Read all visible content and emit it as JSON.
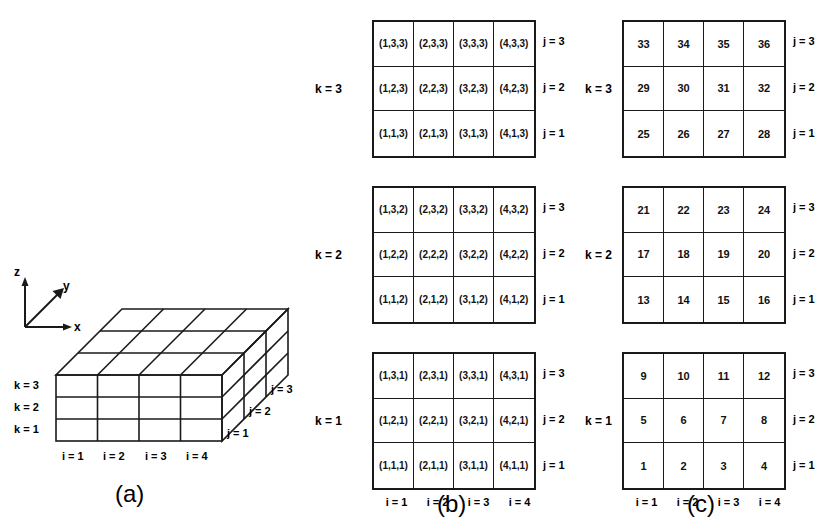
{
  "figure": {
    "panels": [
      {
        "id": "a",
        "caption": "(a)"
      },
      {
        "id": "b",
        "caption": "(b)"
      },
      {
        "id": "c",
        "caption": "(c)"
      }
    ]
  },
  "axes": {
    "x": "x",
    "y": "y",
    "z": "z"
  },
  "panel_a": {
    "k_labels": [
      "k = 3",
      "k = 2",
      "k = 1"
    ],
    "i_labels": [
      "i = 1",
      "i = 2",
      "i = 3",
      "i = 4"
    ],
    "j_labels": [
      "j = 1",
      "j = 2",
      "j = 3"
    ],
    "dims": {
      "ni": 4,
      "nj": 3,
      "nk": 3
    }
  },
  "panel_b": {
    "row_j_labels": [
      "j = 3",
      "j = 2",
      "j = 1"
    ],
    "i_labels": [
      "i = 1",
      "i = 2",
      "i = 3",
      "i = 4"
    ],
    "blocks": [
      {
        "k_label": "k = 3",
        "rows": [
          [
            "(1,3,3)",
            "(2,3,3)",
            "(3,3,3)",
            "(4,3,3)"
          ],
          [
            "(1,2,3)",
            "(2,2,3)",
            "(3,2,3)",
            "(4,2,3)"
          ],
          [
            "(1,1,3)",
            "(2,1,3)",
            "(3,1,3)",
            "(4,1,3)"
          ]
        ]
      },
      {
        "k_label": "k = 2",
        "rows": [
          [
            "(1,3,2)",
            "(2,3,2)",
            "(3,3,2)",
            "(4,3,2)"
          ],
          [
            "(1,2,2)",
            "(2,2,2)",
            "(3,2,2)",
            "(4,2,2)"
          ],
          [
            "(1,1,2)",
            "(2,1,2)",
            "(3,1,2)",
            "(4,1,2)"
          ]
        ]
      },
      {
        "k_label": "k = 1",
        "rows": [
          [
            "(1,3,1)",
            "(2,3,1)",
            "(3,3,1)",
            "(4,3,1)"
          ],
          [
            "(1,2,1)",
            "(2,2,1)",
            "(3,2,1)",
            "(4,2,1)"
          ],
          [
            "(1,1,1)",
            "(2,1,1)",
            "(3,1,1)",
            "(4,1,1)"
          ]
        ]
      }
    ]
  },
  "panel_c": {
    "row_j_labels": [
      "j = 3",
      "j = 2",
      "j = 1"
    ],
    "i_labels": [
      "i = 1",
      "i = 2",
      "i = 3",
      "i = 4"
    ],
    "blocks": [
      {
        "k_label": "k = 3",
        "rows": [
          [
            "33",
            "34",
            "35",
            "36"
          ],
          [
            "29",
            "30",
            "31",
            "32"
          ],
          [
            "25",
            "26",
            "27",
            "28"
          ]
        ]
      },
      {
        "k_label": "k = 2",
        "rows": [
          [
            "21",
            "22",
            "23",
            "24"
          ],
          [
            "17",
            "18",
            "19",
            "20"
          ],
          [
            "13",
            "14",
            "15",
            "16"
          ]
        ]
      },
      {
        "k_label": "k = 1",
        "rows": [
          [
            "9",
            "10",
            "11",
            "12"
          ],
          [
            "5",
            "6",
            "7",
            "8"
          ],
          [
            "1",
            "2",
            "3",
            "4"
          ]
        ]
      }
    ]
  },
  "colors": {
    "stroke": "#1a1a1a",
    "background": "#ffffff",
    "text": "#000000"
  }
}
